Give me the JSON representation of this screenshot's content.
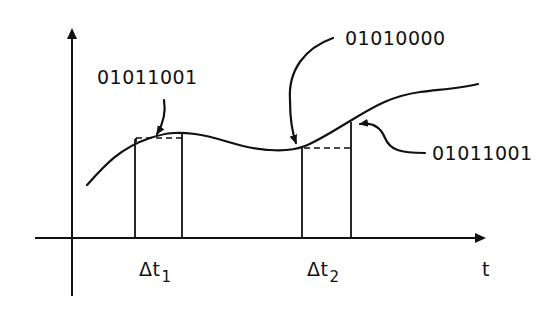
{
  "diagram": {
    "type": "signal-sampling",
    "axes": {
      "x_label": "t",
      "y_label": ""
    },
    "sample_intervals": [
      {
        "label": "Δt",
        "subscript": "1"
      },
      {
        "label": "Δt",
        "subscript": "2"
      }
    ],
    "annotations": [
      {
        "text": "01011001",
        "points_to": "sample value in interval Δt1"
      },
      {
        "text": "01010000",
        "points_to": "start of interval Δt2"
      },
      {
        "text": "01011001",
        "points_to": "end of interval Δt2"
      }
    ],
    "colors": {
      "ink": "#111111",
      "background": "#ffffff"
    }
  }
}
